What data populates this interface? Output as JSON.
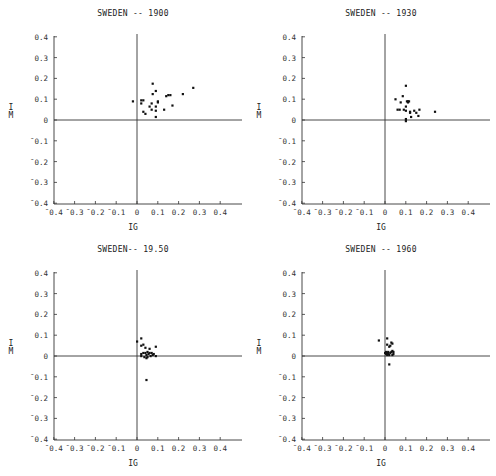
{
  "page": {
    "header_text": "",
    "colors": {
      "axis": "#333333",
      "point": "#111111",
      "background": "#ffffff"
    }
  },
  "chart_data": [
    {
      "type": "scatter",
      "title": "SWEDEN -- 1900",
      "xlabel": "IG",
      "ylabel": "IM",
      "xlim": [
        -0.4,
        0.5
      ],
      "ylim": [
        -0.4,
        0.4
      ],
      "xticks": [
        -0.4,
        -0.3,
        -0.2,
        -0.1,
        0,
        0.1,
        0.2,
        0.3,
        0.4
      ],
      "xtick_labels": [
        "¯0.4",
        "¯0.3",
        "¯0.2",
        "¯0.1",
        "0",
        "0.1",
        "0.2",
        "0.3",
        "0.4"
      ],
      "yticks": [
        0.4,
        0.3,
        0.2,
        0.1,
        0,
        -0.1,
        -0.2,
        -0.3,
        -0.4
      ],
      "ytick_labels": [
        "0.4",
        "0.3",
        "0.2",
        "0.1",
        "0",
        "¯0.1",
        "¯0.2",
        "¯0.3",
        "¯0.4"
      ],
      "grid": false,
      "reference_lines": {
        "x": 0,
        "y": 0
      },
      "points": [
        [
          -0.02,
          0.09
        ],
        [
          0.02,
          0.095
        ],
        [
          0.03,
          0.095
        ],
        [
          0.02,
          0.08
        ],
        [
          0.03,
          0.04
        ],
        [
          0.04,
          0.03
        ],
        [
          0.06,
          0.065
        ],
        [
          0.07,
          0.05
        ],
        [
          0.07,
          0.08
        ],
        [
          0.075,
          0.175
        ],
        [
          0.075,
          0.125
        ],
        [
          0.09,
          0.14
        ],
        [
          0.09,
          0.065
        ],
        [
          0.09,
          0.045
        ],
        [
          0.09,
          0.015
        ],
        [
          0.1,
          0.09
        ],
        [
          0.1,
          0.085
        ],
        [
          0.13,
          0.05
        ],
        [
          0.14,
          0.115
        ],
        [
          0.15,
          0.12
        ],
        [
          0.16,
          0.12
        ],
        [
          0.17,
          0.07
        ],
        [
          0.22,
          0.125
        ],
        [
          0.27,
          0.155
        ]
      ]
    },
    {
      "type": "scatter",
      "title": "SWEDEN -- 1930",
      "xlabel": "IG",
      "ylabel": "IM",
      "xlim": [
        -0.4,
        0.5
      ],
      "ylim": [
        -0.4,
        0.4
      ],
      "xticks": [
        -0.4,
        -0.3,
        -0.2,
        -0.1,
        0,
        0.1,
        0.2,
        0.3,
        0.4
      ],
      "xtick_labels": [
        "¯0.4",
        "¯0.3",
        "¯0.2",
        "¯0.1",
        "0",
        "0.1",
        "0.2",
        "0.3",
        "0.4"
      ],
      "yticks": [
        0.4,
        0.3,
        0.2,
        0.1,
        0,
        -0.1,
        -0.2,
        -0.3,
        -0.4
      ],
      "ytick_labels": [
        "0.4",
        "0.3",
        "0.2",
        "0.1",
        "0",
        "¯0.1",
        "¯0.2",
        "¯0.3",
        "¯0.4"
      ],
      "grid": false,
      "reference_lines": {
        "x": 0,
        "y": 0
      },
      "points": [
        [
          0.05,
          0.1
        ],
        [
          0.06,
          0.05
        ],
        [
          0.07,
          0.05
        ],
        [
          0.075,
          0.085
        ],
        [
          0.085,
          0.115
        ],
        [
          0.09,
          0.05
        ],
        [
          0.1,
          0.165
        ],
        [
          0.1,
          0.065
        ],
        [
          0.1,
          0.045
        ],
        [
          0.1,
          0.005
        ],
        [
          0.1,
          -0.005
        ],
        [
          0.105,
          0.09
        ],
        [
          0.11,
          0.085
        ],
        [
          0.11,
          0.09
        ],
        [
          0.115,
          0.09
        ],
        [
          0.12,
          0.04
        ],
        [
          0.12,
          0.035
        ],
        [
          0.125,
          0.015
        ],
        [
          0.14,
          0.045
        ],
        [
          0.15,
          0.035
        ],
        [
          0.16,
          0.02
        ],
        [
          0.165,
          0.05
        ],
        [
          0.24,
          0.04
        ]
      ]
    },
    {
      "type": "scatter",
      "title": "SWEDEN-- 19.50",
      "xlabel": "IG",
      "ylabel": "IM",
      "xlim": [
        -0.4,
        0.5
      ],
      "ylim": [
        -0.4,
        0.4
      ],
      "xticks": [
        -0.4,
        -0.3,
        -0.2,
        -0.1,
        0,
        0.1,
        0.2,
        0.3,
        0.4
      ],
      "xtick_labels": [
        "¯0.4",
        "¯0.3",
        "¯0.2",
        "¯0.1",
        "0",
        "0.1",
        "0.2",
        "0.3",
        "0.4"
      ],
      "yticks": [
        0.4,
        0.3,
        0.2,
        0.1,
        0,
        -0.1,
        -0.2,
        -0.3,
        -0.4
      ],
      "ytick_labels": [
        "0.4",
        "0.3",
        "0.2",
        "0.1",
        "0",
        "¯0.1",
        "¯0.2",
        "¯0.3",
        "¯0.4"
      ],
      "grid": false,
      "reference_lines": {
        "x": 0,
        "y": 0
      },
      "points": [
        [
          0.0,
          0.07
        ],
        [
          0.02,
          0.085
        ],
        [
          0.02,
          0.05
        ],
        [
          0.03,
          0.055
        ],
        [
          0.04,
          0.04
        ],
        [
          0.02,
          0.01
        ],
        [
          0.02,
          0.0
        ],
        [
          0.03,
          0.015
        ],
        [
          0.04,
          0.015
        ],
        [
          0.045,
          0.005
        ],
        [
          0.05,
          0.02
        ],
        [
          0.05,
          -0.005
        ],
        [
          0.055,
          0.01
        ],
        [
          0.06,
          0.035
        ],
        [
          0.06,
          0.015
        ],
        [
          0.065,
          0.0
        ],
        [
          0.07,
          0.015
        ],
        [
          0.075,
          0.005
        ],
        [
          0.08,
          0.01
        ],
        [
          0.09,
          0.045
        ],
        [
          0.09,
          0.0
        ],
        [
          0.045,
          -0.01
        ],
        [
          0.035,
          -0.005
        ],
        [
          0.045,
          -0.115
        ]
      ]
    },
    {
      "type": "scatter",
      "title": "SWEDEN -- 1960",
      "xlabel": "IG",
      "ylabel": "IM",
      "xlim": [
        -0.4,
        0.5
      ],
      "ylim": [
        -0.4,
        0.4
      ],
      "xticks": [
        -0.4,
        -0.3,
        -0.2,
        -0.1,
        0,
        0.1,
        0.2,
        0.3,
        0.4
      ],
      "xtick_labels": [
        "¯0.4",
        "¯0.3",
        "¯0.2",
        "¯0.1",
        "0",
        "0.1",
        "0.2",
        "0.3",
        "0.4"
      ],
      "yticks": [
        0.4,
        0.3,
        0.2,
        0.1,
        0,
        -0.1,
        -0.2,
        -0.3,
        -0.4
      ],
      "ytick_labels": [
        "0.4",
        "0.3",
        "0.2",
        "0.1",
        "0",
        "¯0.1",
        "¯0.2",
        "¯0.3",
        "¯0.4"
      ],
      "grid": false,
      "reference_lines": {
        "x": 0,
        "y": 0
      },
      "points": [
        [
          -0.03,
          0.075
        ],
        [
          0.01,
          0.085
        ],
        [
          0.01,
          0.055
        ],
        [
          0.02,
          0.045
        ],
        [
          0.025,
          0.05
        ],
        [
          0.03,
          0.065
        ],
        [
          0.035,
          0.06
        ],
        [
          0.0,
          0.015
        ],
        [
          0.005,
          0.01
        ],
        [
          0.005,
          0.02
        ],
        [
          0.01,
          0.015
        ],
        [
          0.01,
          0.005
        ],
        [
          0.015,
          0.02
        ],
        [
          0.015,
          0.01
        ],
        [
          0.02,
          0.005
        ],
        [
          0.025,
          0.015
        ],
        [
          0.03,
          0.02
        ],
        [
          0.035,
          0.025
        ],
        [
          0.04,
          0.02
        ],
        [
          0.04,
          0.01
        ],
        [
          0.035,
          0.005
        ],
        [
          0.02,
          -0.04
        ]
      ]
    }
  ]
}
